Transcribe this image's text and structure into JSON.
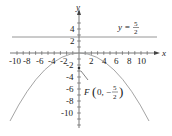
{
  "diagram": {
    "type": "parabola-graph",
    "equation": "x^2 = -10y",
    "axes": {
      "x_label": "x",
      "y_label": "y",
      "x_ticks": [
        "-10",
        "-8",
        "-6",
        "-4",
        "-2",
        "2",
        "4",
        "6",
        "8",
        "10"
      ],
      "y_ticks": [
        "4",
        "2",
        "-2",
        "-4",
        "-6",
        "-8",
        "-10"
      ],
      "x_range": [
        -11,
        12
      ],
      "y_range": [
        -11,
        6
      ]
    },
    "directrix": {
      "label_prefix": "y =",
      "numerator": "5",
      "denominator": "2",
      "value": 2.5
    },
    "focus": {
      "label_prefix": "F",
      "open": "(",
      "x": "0,",
      "sign": "−",
      "numerator": "5",
      "denominator": "2",
      "close": ")",
      "coords": [
        0,
        -2.5
      ]
    },
    "colors": {
      "curve": "#9a9a9a",
      "axes": "#555555",
      "text": "#222222"
    }
  }
}
